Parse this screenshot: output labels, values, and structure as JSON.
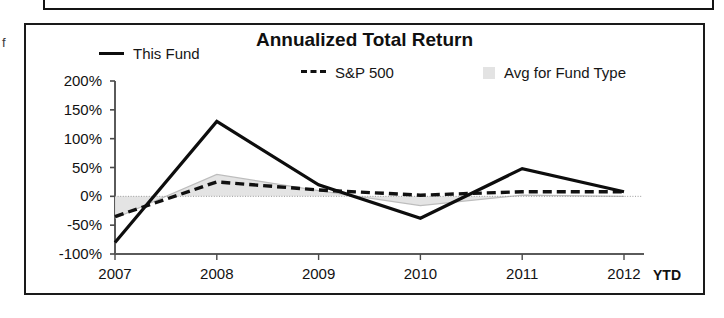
{
  "top_box": {
    "name": "clipped-panel-above"
  },
  "edge_artifact": {
    "glyph": "f"
  },
  "chart_panel": {
    "title": "Annualized Total Return"
  },
  "legend": {
    "items": [
      {
        "label": "This Fund",
        "marker": "solid-line",
        "color": "#0d0d0d"
      },
      {
        "label": "S&P 500",
        "marker": "dashed-line",
        "color": "#111111"
      },
      {
        "label": "Avg for Fund Type",
        "marker": "filled-square",
        "color": "#e3e3e3"
      }
    ]
  },
  "axis": {
    "x_suffix": "YTD"
  },
  "chart_data": {
    "type": "line",
    "title": "Annualized Total Return",
    "xlabel": "",
    "ylabel": "",
    "categories": [
      "2007",
      "2008",
      "2009",
      "2010",
      "2011",
      "2012"
    ],
    "x_tick_labels": [
      "2007",
      "2008",
      "2009",
      "2010",
      "2011",
      "2012"
    ],
    "x_extra_label": "YTD",
    "y_tick_labels": [
      "200%",
      "150%",
      "100%",
      "50%",
      "0%",
      "-50%",
      "-100%"
    ],
    "y_ticks": [
      200,
      150,
      100,
      50,
      0,
      -50,
      -100
    ],
    "ylim": [
      -100,
      200
    ],
    "y_unit": "%",
    "grid": false,
    "legend_position": "top",
    "zero_line": true,
    "series": [
      {
        "name": "This Fund",
        "style": "solid",
        "color": "#0d0d0d",
        "values": [
          -80,
          130,
          20,
          -38,
          48,
          8
        ]
      },
      {
        "name": "S&P 500",
        "style": "dashed",
        "color": "#111111",
        "values": [
          -35,
          25,
          11,
          2,
          8,
          8
        ]
      },
      {
        "name": "Avg for Fund Type",
        "style": "area",
        "color": "#e3e3e3",
        "values": [
          -38,
          38,
          10,
          -16,
          2,
          0
        ]
      }
    ]
  }
}
